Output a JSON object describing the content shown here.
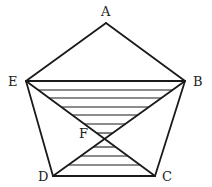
{
  "diagram": {
    "type": "geometry",
    "stroke_color": "#1a1a1a",
    "vertices": {
      "A": {
        "label": "A",
        "x": 106,
        "y": 23
      },
      "B": {
        "label": "B",
        "x": 185,
        "y": 81
      },
      "C": {
        "label": "C",
        "x": 155,
        "y": 176
      },
      "D": {
        "label": "D",
        "x": 53,
        "y": 176
      },
      "E": {
        "label": "E",
        "x": 26,
        "y": 81
      },
      "F": {
        "label": "F",
        "x": 105,
        "y": 139
      }
    },
    "edges": [
      "AB",
      "BC",
      "CD",
      "DE",
      "EA",
      "EB",
      "EC",
      "BD"
    ],
    "hatched_regions": [
      "triangle EFB",
      "triangle DFC"
    ],
    "hatch_y_positions": [
      90,
      98,
      107,
      115,
      124,
      133,
      147,
      156,
      165
    ]
  }
}
